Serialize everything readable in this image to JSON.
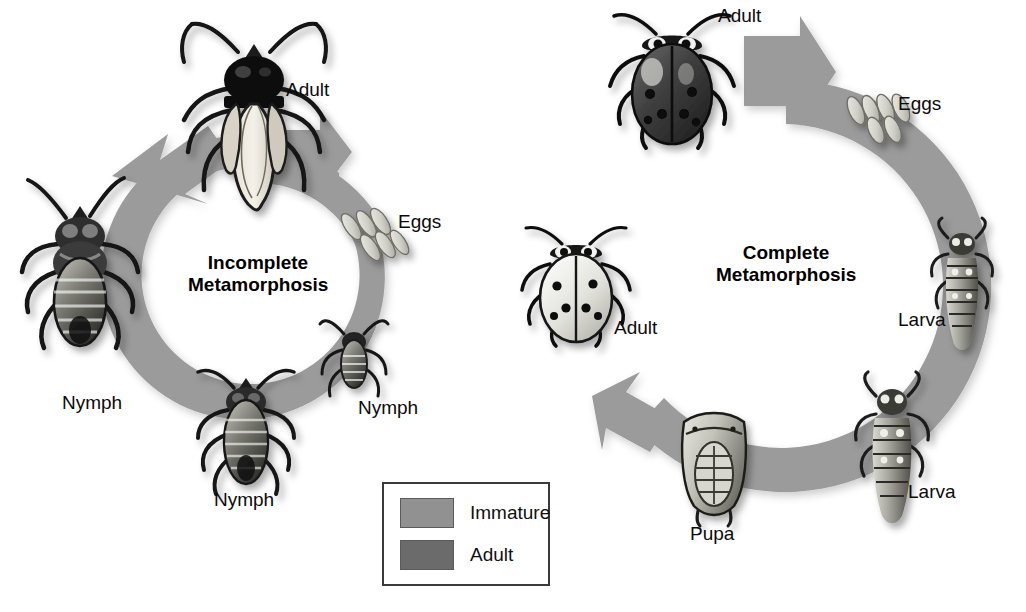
{
  "figure": {
    "background": "#ffffff",
    "width": 1026,
    "height": 612,
    "ring_color": "#9b9b9b",
    "ring_shadow": "#bdbdbd"
  },
  "cycles": [
    {
      "id": "incomplete",
      "title_line1": "Incomplete",
      "title_line2": "Metamorphosis",
      "center_x": 258,
      "center_y": 292,
      "outer_radius": 142,
      "ring_thickness": 33,
      "stages": [
        {
          "key": "adult",
          "label": "Adult",
          "organism": "adult-winged-bug",
          "label_x": 286,
          "label_y": 80,
          "art_x": 188,
          "art_y": 22,
          "art_w": 132,
          "art_h": 190
        },
        {
          "key": "eggs",
          "label": "Eggs",
          "organism": "egg-cluster",
          "label_x": 398,
          "label_y": 212,
          "art_x": 348,
          "art_y": 196,
          "art_w": 54,
          "art_h": 72
        },
        {
          "key": "nymph1",
          "label": "Nymph",
          "organism": "small-nymph",
          "label_x": 358,
          "label_y": 398,
          "art_x": 326,
          "art_y": 322,
          "art_w": 56,
          "art_h": 80
        },
        {
          "key": "nymph2",
          "label": "Nymph",
          "organism": "medium-nymph",
          "label_x": 214,
          "label_y": 490,
          "art_x": 196,
          "art_y": 368,
          "art_w": 100,
          "art_h": 130
        },
        {
          "key": "nymph3",
          "label": "Nymph",
          "organism": "large-nymph",
          "label_x": 62,
          "label_y": 393,
          "art_x": 22,
          "art_y": 196,
          "art_w": 118,
          "art_h": 160
        }
      ]
    },
    {
      "id": "complete",
      "title_line1": "Complete",
      "title_line2": "Metamorphosis",
      "center_x": 786,
      "center_y": 286,
      "outer_radius": 206,
      "ring_thickness": 44,
      "stages": [
        {
          "key": "adult-top",
          "label": "Adult",
          "organism": "ladybug-dark",
          "label_x": 718,
          "label_y": 6,
          "art_x": 612,
          "art_y": 12,
          "art_w": 118,
          "art_h": 140
        },
        {
          "key": "eggs",
          "label": "Eggs",
          "organism": "egg-cluster",
          "label_x": 898,
          "label_y": 94,
          "art_x": 852,
          "art_y": 78,
          "art_w": 62,
          "art_h": 64
        },
        {
          "key": "larva-right",
          "label": "Larva",
          "organism": "ladybug-larva",
          "label_x": 898,
          "label_y": 310,
          "art_x": 932,
          "art_y": 226,
          "art_w": 60,
          "art_h": 126
        },
        {
          "key": "larva-lower",
          "label": "Larva",
          "organism": "ladybug-larva",
          "label_x": 908,
          "label_y": 482,
          "art_x": 856,
          "art_y": 382,
          "art_w": 72,
          "art_h": 142
        },
        {
          "key": "pupa",
          "label": "Pupa",
          "organism": "ladybug-pupa",
          "label_x": 690,
          "label_y": 524,
          "art_x": 676,
          "art_y": 408,
          "art_w": 76,
          "art_h": 104
        },
        {
          "key": "adult-left",
          "label": "Adult",
          "organism": "ladybug-pale",
          "label_x": 614,
          "label_y": 318,
          "art_x": 526,
          "art_y": 228,
          "art_w": 104,
          "art_h": 110
        }
      ]
    }
  ],
  "legend": {
    "x": 382,
    "y": 482,
    "width": 168,
    "height": 104,
    "items": [
      {
        "label": "Immature",
        "color": "#919191"
      },
      {
        "label": "Adult",
        "color": "#6b6b6b"
      }
    ]
  }
}
